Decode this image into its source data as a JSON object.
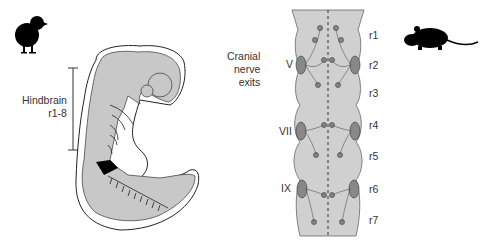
{
  "left_panel": {
    "organism_icon": "chick-silhouette-icon",
    "hindbrain_label": "Hindbrain",
    "hindbrain_range": "r1-8"
  },
  "right_panel": {
    "organism_icon": "mouse-silhouette-icon",
    "cranial_label_line1": "Cranial",
    "cranial_label_line2": "nerve",
    "cranial_label_line3": "exits",
    "nerves": [
      "V",
      "VII",
      "IX"
    ],
    "rhombomeres": [
      "r1",
      "r2",
      "r3",
      "r4",
      "r5",
      "r6",
      "r7"
    ]
  },
  "colors": {
    "tissue": "#c8c8c8",
    "outline": "#222222",
    "text": "#333333"
  }
}
